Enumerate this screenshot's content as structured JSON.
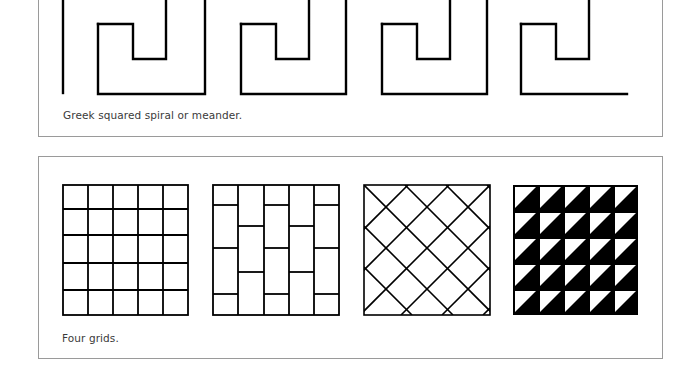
{
  "figures": [
    {
      "id": "meander",
      "caption": "Greek squared spiral or meander.",
      "description": "Greek key border made of four squared spiral units"
    },
    {
      "id": "grids",
      "caption": "Four grids.",
      "items": [
        {
          "name": "square-grid",
          "rows": 5,
          "cols": 5
        },
        {
          "name": "brick-grid",
          "cols": 5,
          "pattern": "staggered vertical rectangles"
        },
        {
          "name": "diagonal-grid",
          "pattern": "diamond lattice"
        },
        {
          "name": "triangle-grid",
          "rows": 5,
          "cols": 5,
          "pattern": "half-black diagonal triangles"
        }
      ]
    }
  ],
  "colors": {
    "line": "#000000",
    "border": "#9a9a9a",
    "caption": "#3a3a3a"
  }
}
